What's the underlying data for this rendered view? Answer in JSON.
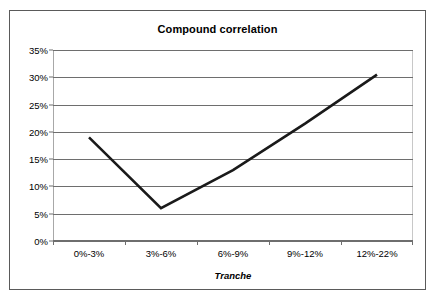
{
  "chart_data": {
    "type": "line",
    "title": "Compound correlation",
    "xlabel": "Tranche",
    "ylabel": "",
    "categories": [
      "0%-3%",
      "3%-6%",
      "6%-9%",
      "9%-12%",
      "12%-22%"
    ],
    "values": [
      19,
      6,
      13,
      21.5,
      30.5
    ],
    "series": [
      {
        "name": "Compound correlation",
        "values": [
          19,
          6,
          13,
          21.5,
          30.5
        ],
        "color": "#1a1a1a"
      }
    ],
    "ylim": [
      0,
      35
    ],
    "ytick_values": [
      0,
      5,
      10,
      15,
      20,
      25,
      30,
      35
    ],
    "ytick_labels": [
      "0%",
      "5%",
      "10%",
      "15%",
      "20%",
      "25%",
      "30%",
      "35%"
    ],
    "grid": "horizontal",
    "legend": "none",
    "value_suffix": "%"
  },
  "colors": {
    "line": "#1a1a1a",
    "gridline": "#6e6e6e",
    "frame": "#5a5a5a",
    "plot_background": "#ffffff",
    "text": "#000000"
  }
}
